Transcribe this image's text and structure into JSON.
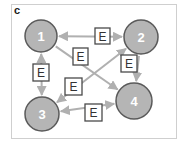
{
  "panel": {
    "label": "c"
  },
  "colors": {
    "node_fill": "#b5b5b5",
    "node_stroke": "#5a5a5a",
    "edge": "#b0b0b0",
    "box_stroke": "#4a4a4a",
    "frame": "#cfcfcf"
  },
  "nodes": [
    {
      "id": "1",
      "label": "1",
      "cx": 41,
      "cy": 36,
      "r": 16
    },
    {
      "id": "2",
      "label": "2",
      "cx": 141,
      "cy": 37,
      "r": 17
    },
    {
      "id": "3",
      "label": "3",
      "cx": 42,
      "cy": 114,
      "r": 17
    },
    {
      "id": "4",
      "label": "4",
      "cx": 134,
      "cy": 101,
      "r": 18
    }
  ],
  "edges": [
    {
      "from": "1",
      "to": "2",
      "bidirectional": true,
      "label": "E",
      "box": {
        "x": 95,
        "y": 28,
        "w": 15,
        "h": 16
      }
    },
    {
      "from": "1",
      "to": "4",
      "bidirectional": false,
      "label": "E",
      "box": {
        "x": 73,
        "y": 48,
        "w": 15,
        "h": 17
      }
    },
    {
      "from": "1",
      "to": "3",
      "bidirectional": true,
      "label": "E",
      "box": {
        "x": 33,
        "y": 64,
        "w": 16,
        "h": 17
      }
    },
    {
      "from": "2",
      "to": "3",
      "bidirectional": true,
      "label": "E",
      "box": {
        "x": 65,
        "y": 78,
        "w": 17,
        "h": 17
      }
    },
    {
      "from": "2",
      "to": "4",
      "bidirectional": false,
      "label": "E",
      "box": {
        "x": 121,
        "y": 55,
        "w": 16,
        "h": 17
      }
    },
    {
      "from": "3",
      "to": "4",
      "bidirectional": true,
      "label": "E",
      "box": {
        "x": 85,
        "y": 104,
        "w": 17,
        "h": 17
      }
    }
  ]
}
